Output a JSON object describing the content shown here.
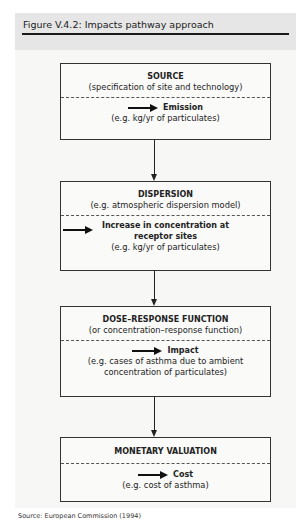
{
  "figure": {
    "title": "Figure V.4.2: Impacts pathway approach",
    "source": "Source: European Commission (1994)"
  },
  "boxes": [
    {
      "heading": "SOURCE",
      "subheading": "(specification of site and technology)",
      "output_label": "Emission",
      "output_detail": "(e.g. kg/yr of particulates)"
    },
    {
      "heading": "DISPERSION",
      "subheading": "(e.g. atmospheric dispersion model)",
      "output_label_line1": "Increase in concentration at",
      "output_label_line2": "receptor sites",
      "output_detail": "(e.g. kg/yr of particulates)"
    },
    {
      "heading": "DOSE–RESPONSE FUNCTION",
      "subheading": "(or concentration–response function)",
      "output_label": "Impact",
      "output_detail_line1": "(e.g. cases of asthma due to ambient",
      "output_detail_line2": "concentration of particulates)"
    },
    {
      "heading": "MONETARY VALUATION",
      "output_label": "Cost",
      "output_detail": "(e.g. cost of asthma)"
    }
  ],
  "icons": {
    "output_arrow": "right-arrow",
    "flow_arrow": "down-arrow"
  }
}
